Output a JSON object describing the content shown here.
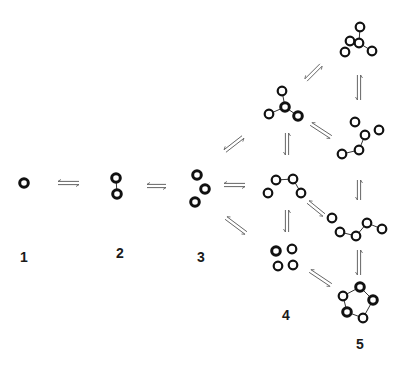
{
  "diagram": {
    "type": "cluster-growth-equilibria",
    "colors": {
      "atom_outline": "#111111",
      "atom_fill": "#ffffff",
      "bond": "#333333",
      "arrow": "#555555",
      "label": "#1a1a1a"
    },
    "labels": [
      {
        "id": "1",
        "text": "1",
        "x": 24,
        "y": 257
      },
      {
        "id": "2",
        "text": "2",
        "x": 120,
        "y": 253
      },
      {
        "id": "3",
        "text": "3",
        "x": 201,
        "y": 257
      },
      {
        "id": "4",
        "text": "4",
        "x": 286,
        "y": 315
      },
      {
        "id": "5",
        "text": "5",
        "x": 360,
        "y": 344
      }
    ],
    "clusters": [
      {
        "name": "monomer",
        "atoms": [
          [
            24,
            183
          ]
        ],
        "bonds": [],
        "heavy": [
          0
        ]
      },
      {
        "name": "dimer",
        "atoms": [
          [
            116,
            178
          ],
          [
            117,
            194
          ]
        ],
        "bonds": [
          [
            0,
            1
          ]
        ],
        "heavy": [
          0,
          1
        ]
      },
      {
        "name": "trimer",
        "atoms": [
          [
            197,
            175
          ],
          [
            205,
            189
          ],
          [
            195,
            202
          ]
        ],
        "bonds": [],
        "heavy": [
          0,
          1,
          2
        ]
      },
      {
        "name": "tetramer-star",
        "atoms": [
          [
            282,
            91
          ],
          [
            285,
            107
          ],
          [
            269,
            114
          ],
          [
            298,
            116
          ]
        ],
        "bonds": [
          [
            0,
            1
          ],
          [
            1,
            2
          ],
          [
            1,
            3
          ]
        ],
        "heavy": [
          1,
          3
        ]
      },
      {
        "name": "tetramer-chain",
        "atoms": [
          [
            268,
            193
          ],
          [
            276,
            180
          ],
          [
            293,
            179
          ],
          [
            301,
            193
          ]
        ],
        "bonds": [
          [
            1,
            2
          ],
          [
            2,
            3
          ]
        ],
        "heavy": []
      },
      {
        "name": "tetramer-square",
        "atoms": [
          [
            276,
            251
          ],
          [
            292,
            249
          ],
          [
            278,
            266
          ],
          [
            293,
            265
          ]
        ],
        "bonds": [],
        "heavy": [
          0
        ]
      },
      {
        "name": "pentamer-compact",
        "atoms": [
          [
            360,
            27
          ],
          [
            350,
            41
          ],
          [
            359,
            43
          ],
          [
            345,
            52
          ],
          [
            372,
            51
          ]
        ],
        "bonds": [
          [
            0,
            2
          ],
          [
            1,
            2
          ],
          [
            2,
            4
          ]
        ],
        "heavy": []
      },
      {
        "name": "pentamer-branched",
        "atoms": [
          [
            355,
            122
          ],
          [
            365,
            135
          ],
          [
            359,
            150
          ],
          [
            342,
            154
          ],
          [
            379,
            130
          ]
        ],
        "bonds": [
          [
            1,
            2
          ],
          [
            2,
            3
          ]
        ],
        "heavy": []
      },
      {
        "name": "pentamer-chain",
        "atoms": [
          [
            332,
            218
          ],
          [
            340,
            232
          ],
          [
            356,
            236
          ],
          [
            367,
            223
          ],
          [
            382,
            229
          ]
        ],
        "bonds": [
          [
            1,
            2
          ],
          [
            2,
            3
          ],
          [
            3,
            4
          ]
        ],
        "heavy": []
      },
      {
        "name": "hexamer-ring",
        "atoms": [
          [
            360,
            287
          ],
          [
            343,
            296
          ],
          [
            373,
            300
          ],
          [
            347,
            312
          ],
          [
            363,
            318
          ]
        ],
        "bonds": [
          [
            0,
            1
          ],
          [
            0,
            2
          ],
          [
            1,
            3
          ],
          [
            2,
            4
          ],
          [
            3,
            4
          ]
        ],
        "heavy": [
          0,
          2,
          3
        ]
      }
    ],
    "arrows": [
      {
        "from": [
          58,
          183
        ],
        "to": [
          79,
          183
        ]
      },
      {
        "from": [
          147,
          186
        ],
        "to": [
          166,
          186
        ]
      },
      {
        "from": [
          225,
          151
        ],
        "to": [
          243,
          137
        ]
      },
      {
        "from": [
          224,
          185
        ],
        "to": [
          245,
          185
        ]
      },
      {
        "from": [
          226,
          218
        ],
        "to": [
          246,
          233
        ]
      },
      {
        "from": [
          306,
          80
        ],
        "to": [
          321,
          65
        ]
      },
      {
        "from": [
          287,
          133
        ],
        "to": [
          287,
          155
        ]
      },
      {
        "from": [
          359,
          75
        ],
        "to": [
          359,
          100
        ]
      },
      {
        "from": [
          311,
          124
        ],
        "to": [
          331,
          137
        ]
      },
      {
        "from": [
          287,
          210
        ],
        "to": [
          287,
          232
        ]
      },
      {
        "from": [
          359,
          180
        ],
        "to": [
          359,
          200
        ]
      },
      {
        "from": [
          308,
          202
        ],
        "to": [
          324,
          215
        ]
      },
      {
        "from": [
          359,
          250
        ],
        "to": [
          359,
          275
        ]
      },
      {
        "from": [
          310,
          271
        ],
        "to": [
          331,
          285
        ]
      }
    ]
  }
}
